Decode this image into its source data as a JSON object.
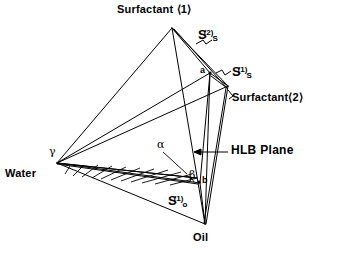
{
  "figure": {
    "type": "tetrahedron-phase-diagram",
    "background_color": "#ffffff",
    "line_color": "#000000",
    "vertices": {
      "surfactant1": {
        "label": "Surfactant ⟨1⟩",
        "x": 172,
        "y": 28
      },
      "surfactant2": {
        "label": "Surfactant⟨2⟩",
        "x": 228,
        "y": 85
      },
      "water": {
        "label": "Water",
        "x": 57,
        "y": 163
      },
      "oil": {
        "label": "Oil",
        "x": 205,
        "y": 224
      }
    },
    "points": {
      "a": {
        "label": "a",
        "x": 210,
        "y": 73
      },
      "b": {
        "label": "b",
        "x": 200,
        "y": 182
      },
      "gamma": {
        "label": "γ",
        "x": 57,
        "y": 163
      },
      "alpha": {
        "label": "α",
        "x": 160,
        "y": 146
      },
      "beta": {
        "label": "β",
        "x": 193,
        "y": 175
      }
    },
    "annotations": {
      "hlb_plane": "HLB Plane",
      "s_s_2": {
        "base": "S",
        "sub": "S",
        "sup": "(2)"
      },
      "s_s_1": {
        "base": "S",
        "sub": "S",
        "sup": "(1)"
      },
      "s_o_1": {
        "base": "S",
        "sub": "o",
        "sup": "(1)"
      }
    },
    "regions": {
      "hatched_region_name": "alpha-phase-hatched-triangle",
      "hatch_line_count": 10
    }
  }
}
